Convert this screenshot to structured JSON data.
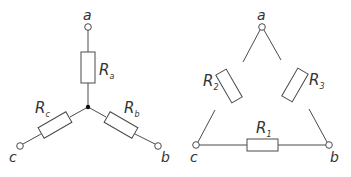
{
  "star": {
    "nodes": {
      "a": "a",
      "b": "b",
      "c": "c"
    },
    "resistors": {
      "ra": {
        "main": "R",
        "sub": "a"
      },
      "rb": {
        "main": "R",
        "sub": "b"
      },
      "rc": {
        "main": "R",
        "sub": "c"
      }
    }
  },
  "delta": {
    "nodes": {
      "a": "a",
      "b": "b",
      "c": "c"
    },
    "resistors": {
      "r1": {
        "main": "R",
        "sub": "1"
      },
      "r2": {
        "main": "R",
        "sub": "2"
      },
      "r3": {
        "main": "R",
        "sub": "3"
      }
    }
  },
  "colors": {
    "line": "#4a4a4a",
    "text": "#333333",
    "background": "#ffffff"
  }
}
